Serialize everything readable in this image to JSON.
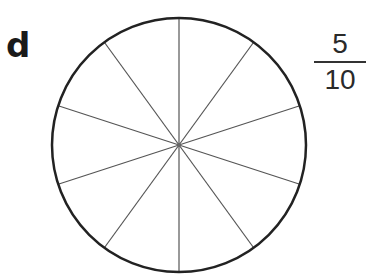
{
  "question": {
    "label": "d",
    "fraction": {
      "numerator": "5",
      "denominator": "10"
    }
  },
  "circle": {
    "center_x": 179,
    "center_y": 145,
    "radius": 127,
    "sectors": 10,
    "shaded_sectors": 0,
    "outline_color": "#222222",
    "divider_color": "#555555"
  }
}
